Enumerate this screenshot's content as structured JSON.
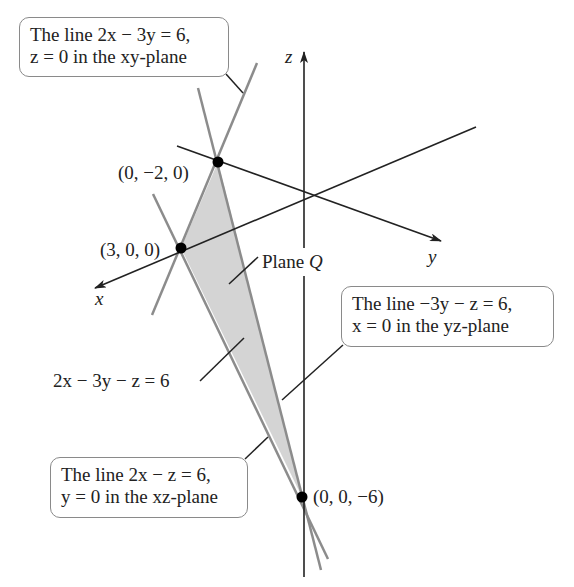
{
  "diagram": {
    "colors": {
      "axis": "#222222",
      "trace_line": "#8c8c8c",
      "plane_fill": "#d4d4d4",
      "point": "#000000",
      "callout_border": "#8a8a8a"
    },
    "axes": {
      "x_label": "x",
      "y_label": "y",
      "z_label": "z"
    },
    "points": [
      {
        "label": "(0, −2, 0)",
        "coords": [
          0,
          -2,
          0
        ]
      },
      {
        "label": "(3, 0, 0)",
        "coords": [
          3,
          0,
          0
        ]
      },
      {
        "label": "(0, 0, −6)",
        "coords": [
          0,
          0,
          -6
        ]
      }
    ],
    "plane_label": {
      "prefix": "Plane ",
      "name": "Q"
    },
    "equation_label": "2x − 3y − z = 6",
    "callouts": {
      "xy": {
        "line1": "The line 2x − 3y = 6,",
        "line2": "z = 0 in the xy-plane"
      },
      "yz": {
        "line1": "The line −3y − z = 6,",
        "line2": "x = 0 in the yz-plane"
      },
      "xz": {
        "line1": "The line 2x − z = 6,",
        "line2": "y = 0 in the xz-plane"
      }
    }
  }
}
